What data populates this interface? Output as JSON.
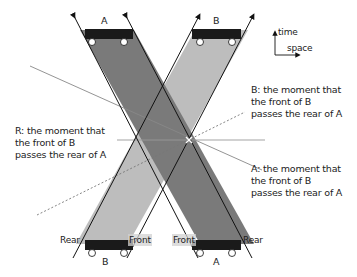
{
  "axes": {
    "time_label": "time",
    "space_label": "space"
  },
  "trains": {
    "A": {
      "label_top": "A",
      "label_bottom": "A",
      "color": "#7a7a7a",
      "front_label": "Front",
      "rear_label": "Rear"
    },
    "B": {
      "label_top": "B",
      "label_bottom": "B",
      "color": "#bdbdbd",
      "front_label": "Front",
      "rear_label": "Rear"
    }
  },
  "annotations": {
    "R": {
      "line1": "R: the moment that",
      "line2": "the front of B",
      "line3": "passes the rear of A"
    },
    "B": {
      "line1": "B: the moment that",
      "line2": "the front of B",
      "line3": "passes the rear of A"
    },
    "A": {
      "line1": "A: the moment that",
      "line2": "the front of B",
      "line3": "passes the rear of A"
    }
  },
  "colors": {
    "train_body": "#1a1a1a",
    "strip_A": "#7a7a7a",
    "strip_B": "#bdbdbd",
    "overlap": "#8c8c8c",
    "edge": "#111111",
    "sim_line": "#888888"
  }
}
